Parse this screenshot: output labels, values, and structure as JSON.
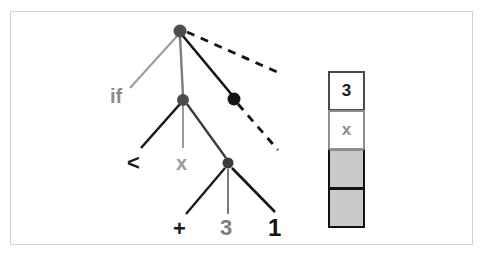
{
  "figure": {
    "background_color": "#ffffff",
    "frame_color": "#d2d2d2"
  },
  "tree": {
    "description": "Expression tree for an if-expression being evaluated",
    "nodes": [
      {
        "id": "root",
        "x": 180,
        "y": 31,
        "radius": 6.5,
        "color": "#4d4d4d",
        "label": ""
      },
      {
        "id": "mid",
        "x": 183,
        "y": 100,
        "radius": 6.0,
        "color": "#4d4d4d",
        "label": ""
      },
      {
        "id": "right",
        "x": 234,
        "y": 99,
        "radius": 6.5,
        "color": "#141414",
        "label": ""
      },
      {
        "id": "low",
        "x": 228,
        "y": 163,
        "radius": 5.5,
        "color": "#3a3a3a",
        "label": ""
      }
    ],
    "edges": [
      {
        "from": "root",
        "to": "if-label",
        "style": "solid",
        "color": "#9a9a9a",
        "width": 2.0
      },
      {
        "from": "root",
        "to": "mid",
        "style": "solid",
        "color": "#7d7d7d",
        "width": 2.2
      },
      {
        "from": "root",
        "to": "right",
        "style": "solid",
        "color": "#141414",
        "width": 2.6
      },
      {
        "from": "root",
        "to": "dash-1",
        "style": "dashed",
        "color": "#111111",
        "width": 2.6
      },
      {
        "from": "right",
        "to": "dash-2",
        "style": "dashed",
        "color": "#111111",
        "width": 2.6
      },
      {
        "from": "mid",
        "to": "lt-label",
        "style": "solid",
        "color": "#1b1b1b",
        "width": 2.6
      },
      {
        "from": "mid",
        "to": "x-label",
        "style": "solid",
        "color": "#9a9a9a",
        "width": 2.0
      },
      {
        "from": "mid",
        "to": "low",
        "style": "solid",
        "color": "#3a3a3a",
        "width": 2.2
      },
      {
        "from": "low",
        "to": "plus-label",
        "style": "solid",
        "color": "#1b1b1b",
        "width": 2.4
      },
      {
        "from": "low",
        "to": "three-label",
        "style": "solid",
        "color": "#7d7d7d",
        "width": 2.0
      },
      {
        "from": "low",
        "to": "one-label",
        "style": "solid",
        "color": "#141414",
        "width": 2.6
      }
    ],
    "labels": [
      {
        "id": "if-label",
        "text": "if",
        "color": "#8c8c8c"
      },
      {
        "id": "lt-label",
        "text": "<",
        "color": "#1b1b1b"
      },
      {
        "id": "x-label",
        "text": "x",
        "color": "#9a9a9a"
      },
      {
        "id": "plus-label",
        "text": "+",
        "color": "#1b1b1b"
      },
      {
        "id": "three-label",
        "text": "3",
        "color": "#7d7d7d"
      },
      {
        "id": "one-label",
        "text": "1",
        "color": "#141414"
      }
    ]
  },
  "stack": {
    "cells": [
      {
        "index": 0,
        "value": "3",
        "filled": false,
        "text_color": "#1b1b1b",
        "border_color": "#4a4a4a",
        "background": "#ffffff"
      },
      {
        "index": 1,
        "value": "x",
        "filled": false,
        "text_color": "#8e8e8e",
        "border_color": "#8e8e8e",
        "background": "#ffffff"
      },
      {
        "index": 2,
        "value": "",
        "filled": true,
        "text_color": "#c9c9c9",
        "border_color": "#111111",
        "background": "#c9c9c9"
      },
      {
        "index": 3,
        "value": "",
        "filled": true,
        "text_color": "#c9c9c9",
        "border_color": "#111111",
        "background": "#c9c9c9"
      }
    ]
  }
}
